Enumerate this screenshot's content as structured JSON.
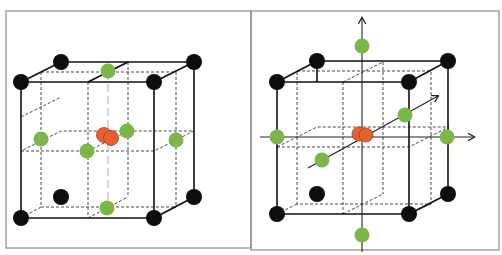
{
  "figure": {
    "panels": [
      {
        "id": "left",
        "description": "Cubic lattice with corner atoms, face-centre atoms and central ion",
        "has_axes": false
      },
      {
        "id": "right",
        "description": "Same lattice with x, y, z axes through the central ion; ligands on axes outside cube",
        "has_axes": true
      }
    ],
    "legend": {
      "corner_atom_color": "#0d0d0d",
      "ligand_color": "#7ab648",
      "central_ion_color": "#e8602c"
    },
    "counts": {
      "left": {
        "corner_atoms": 8,
        "ligands": 6,
        "central_ion": 1
      },
      "right": {
        "corner_atoms": 8,
        "ligands": 6,
        "central_ion": 1
      }
    }
  }
}
